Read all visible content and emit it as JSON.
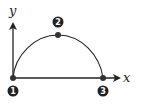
{
  "diagram": {
    "type": "projectile-trajectory",
    "axes": {
      "x_label": "x",
      "y_label": "y"
    },
    "points": [
      {
        "id": "1",
        "label": "1",
        "description": "launch point at origin"
      },
      {
        "id": "2",
        "label": "2",
        "description": "peak of trajectory"
      },
      {
        "id": "3",
        "label": "3",
        "description": "landing point on x-axis"
      }
    ],
    "colors": {
      "stroke": "#222222",
      "point": "#333333",
      "badge": "#222222",
      "background": "#ffffff"
    }
  }
}
